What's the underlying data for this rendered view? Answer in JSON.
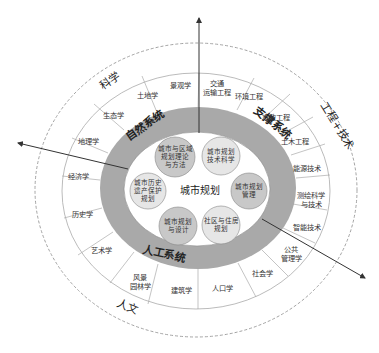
{
  "diagram": {
    "center": {
      "label": "城市规划"
    },
    "core_bubbles": [
      {
        "lines": [
          "城市与区域",
          "规划理论",
          "与方法"
        ],
        "shade": "dark"
      },
      {
        "lines": [
          "城市规划",
          "技术科学"
        ],
        "shade": "light"
      },
      {
        "lines": [
          "城市规划",
          "管理"
        ],
        "shade": "dark"
      },
      {
        "lines": [
          "社区与住房",
          "规划"
        ],
        "shade": "light"
      },
      {
        "lines": [
          "城市规划",
          "与设计"
        ],
        "shade": "dark"
      },
      {
        "lines": [
          "城市历史",
          "遗产保护",
          "规划"
        ],
        "shade": "light"
      }
    ],
    "systems": [
      {
        "label": "自然系统"
      },
      {
        "label": "支撑系统"
      },
      {
        "label": "人工系统"
      }
    ],
    "disciplines": [
      {
        "lines": [
          "景观学"
        ]
      },
      {
        "lines": [
          "交通",
          "运输工程"
        ]
      },
      {
        "lines": [
          "环境工程"
        ]
      },
      {
        "lines": [
          "市政工程"
        ]
      },
      {
        "lines": [
          "土木工程"
        ]
      },
      {
        "lines": [
          "能源技术"
        ]
      },
      {
        "lines": [
          "测绘科学",
          "与技术"
        ]
      },
      {
        "lines": [
          "智能技术"
        ]
      },
      {
        "lines": [
          "公共",
          "管理学"
        ]
      },
      {
        "lines": [
          "社会学"
        ]
      },
      {
        "lines": [
          "人口学"
        ]
      },
      {
        "lines": [
          "建筑学"
        ]
      },
      {
        "lines": [
          "风景",
          "园林学"
        ]
      },
      {
        "lines": [
          "艺术学"
        ]
      },
      {
        "lines": [
          "历史学"
        ]
      },
      {
        "lines": [
          "经济学"
        ]
      },
      {
        "lines": [
          "地理学"
        ]
      },
      {
        "lines": [
          "生态学"
        ]
      },
      {
        "lines": [
          "土地学"
        ]
      }
    ],
    "domains": [
      {
        "label": "科学"
      },
      {
        "label": "工程+技术"
      },
      {
        "label": "人文"
      }
    ],
    "colors": {
      "band": "#a9a9a9",
      "bubble_dark": "#c8c8c8",
      "bubble_light": "#e6e6e6",
      "lines": "#9a9a9a",
      "arrow": "#333333",
      "dashed": "#999999"
    }
  }
}
